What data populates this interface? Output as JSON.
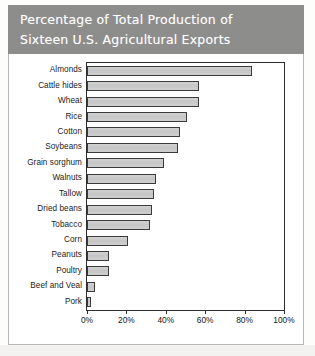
{
  "title": {
    "line1": "Percentage of Total Production of",
    "line2": "Sixteen U.S. Agricultural Exports"
  },
  "colors": {
    "banner": "#8d8d8c",
    "bar_fill": "#c9c9c9",
    "bar_border": "#3a3a3a",
    "axis": "#2e2e2e",
    "frame": "#b9b7b3"
  },
  "chart_data": {
    "type": "bar",
    "orientation": "horizontal",
    "title": "Percentage of Total Production of Sixteen U.S. Agricultural Exports",
    "xlabel": "",
    "ylabel": "",
    "xlim": [
      0,
      100
    ],
    "grid": false,
    "legend": false,
    "tick_labels": [
      "0%",
      "20%",
      "40%",
      "60%",
      "80%",
      "100%"
    ],
    "ticks": [
      0,
      20,
      40,
      60,
      80,
      100
    ],
    "categories": [
      "Almonds",
      "Cattle hides",
      "Wheat",
      "Rice",
      "Cotton",
      "Soybeans",
      "Grain sorghum",
      "Walnuts",
      "Tallow",
      "Dried beans",
      "Tobacco",
      "Corn",
      "Peanuts",
      "Poultry",
      "Beef and Veal",
      "Pork"
    ],
    "values": [
      84,
      57,
      57,
      51,
      47,
      46,
      39,
      35,
      34,
      33,
      32,
      21,
      11,
      11,
      4,
      2
    ]
  }
}
